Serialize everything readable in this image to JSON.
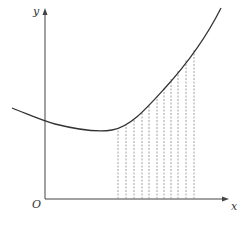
{
  "diagram": {
    "type": "area-under-curve-riemann",
    "axes": {
      "x_label": "x",
      "y_label": "y",
      "origin_label": "O"
    },
    "curve": {
      "description": "smooth curve decreasing slightly then increasing steeply"
    },
    "strips": {
      "count": 11,
      "style": "dashed vertical lines from x-axis to curve"
    },
    "colors": {
      "axis": "#444444",
      "curve": "#333333",
      "dashes": "#888888",
      "background": "#ffffff"
    }
  }
}
